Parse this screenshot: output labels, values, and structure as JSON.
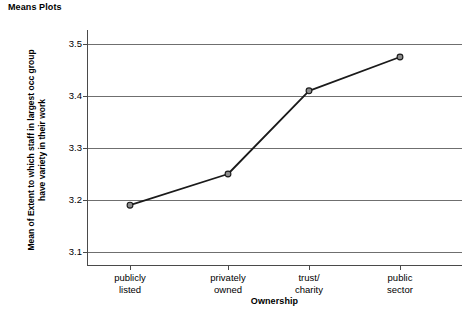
{
  "chart_data": {
    "type": "line",
    "title": "Means Plots",
    "xlabel": "Ownership",
    "ylabel": "Mean of Extent to which staff in largest occ group have variety in their work",
    "ylabel_lines": [
      "Mean of Extent to which staff in largest occ group",
      "have variety in their work"
    ],
    "categories": [
      "publicly listed",
      "privately owned",
      "trust/ charity",
      "public sector"
    ],
    "category_lines": [
      [
        "publicly",
        "listed"
      ],
      [
        "privately",
        "owned"
      ],
      [
        "trust/",
        "charity"
      ],
      [
        "public",
        "sector"
      ]
    ],
    "values": [
      3.19,
      3.25,
      3.41,
      3.475
    ],
    "ylim": [
      3.05,
      3.54
    ],
    "yticks": [
      3.1,
      3.2,
      3.3,
      3.4,
      3.5
    ],
    "ytick_labels": [
      "3.1",
      "3.2",
      "3.3",
      "3.4",
      "3.5"
    ],
    "grid": true,
    "legend": false,
    "colors": {
      "line": "#1a1a1a",
      "marker_fill": "#8c8c8c",
      "marker_stroke": "#1a1a1a",
      "gridline": "#6f6f6f",
      "axis": "#4a4a4a",
      "background": "#ffffff"
    }
  }
}
